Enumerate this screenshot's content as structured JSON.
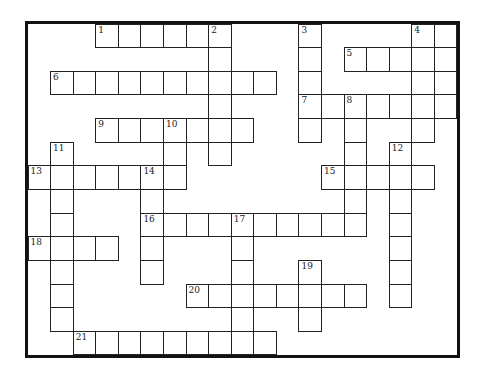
{
  "puzzle": {
    "title": "Crossword puzzle grid",
    "rows": 14,
    "cols": 19,
    "colors": {
      "line": "#222222",
      "border": "#111111",
      "background": "#ffffff"
    },
    "words": [
      {
        "number": "1",
        "direction": "across",
        "row": 0,
        "col": 3,
        "length": 6
      },
      {
        "number": "2",
        "direction": "down",
        "row": 0,
        "col": 8,
        "length": 6
      },
      {
        "number": "3",
        "direction": "down",
        "row": 0,
        "col": 12,
        "length": 5
      },
      {
        "number": "4",
        "direction": "down",
        "row": 0,
        "col": 17,
        "length": 5
      },
      {
        "number": "",
        "direction": "down",
        "row": 0,
        "col": 18,
        "length": 4
      },
      {
        "number": "5",
        "direction": "across",
        "row": 1,
        "col": 14,
        "length": 5
      },
      {
        "number": "6",
        "direction": "across",
        "row": 2,
        "col": 1,
        "length": 10
      },
      {
        "number": "7",
        "direction": "across",
        "row": 3,
        "col": 12,
        "length": 7
      },
      {
        "number": "8",
        "direction": "down",
        "row": 3,
        "col": 14,
        "length": 6
      },
      {
        "number": "9",
        "direction": "across",
        "row": 4,
        "col": 3,
        "length": 7
      },
      {
        "number": "10",
        "direction": "down",
        "row": 4,
        "col": 6,
        "length": 3
      },
      {
        "number": "11",
        "direction": "down",
        "row": 5,
        "col": 1,
        "length": 8
      },
      {
        "number": "12",
        "direction": "down",
        "row": 5,
        "col": 16,
        "length": 7
      },
      {
        "number": "13",
        "direction": "across",
        "row": 6,
        "col": 0,
        "length": 7
      },
      {
        "number": "14",
        "direction": "down",
        "row": 6,
        "col": 5,
        "length": 5
      },
      {
        "number": "15",
        "direction": "across",
        "row": 6,
        "col": 13,
        "length": 5
      },
      {
        "number": "16",
        "direction": "across",
        "row": 8,
        "col": 5,
        "length": 10
      },
      {
        "number": "17",
        "direction": "down",
        "row": 8,
        "col": 9,
        "length": 6
      },
      {
        "number": "18",
        "direction": "across",
        "row": 9,
        "col": 0,
        "length": 4
      },
      {
        "number": "19",
        "direction": "down",
        "row": 10,
        "col": 12,
        "length": 3
      },
      {
        "number": "20",
        "direction": "across",
        "row": 11,
        "col": 7,
        "length": 8
      },
      {
        "number": "21",
        "direction": "across",
        "row": 13,
        "col": 2,
        "length": 9
      }
    ]
  }
}
